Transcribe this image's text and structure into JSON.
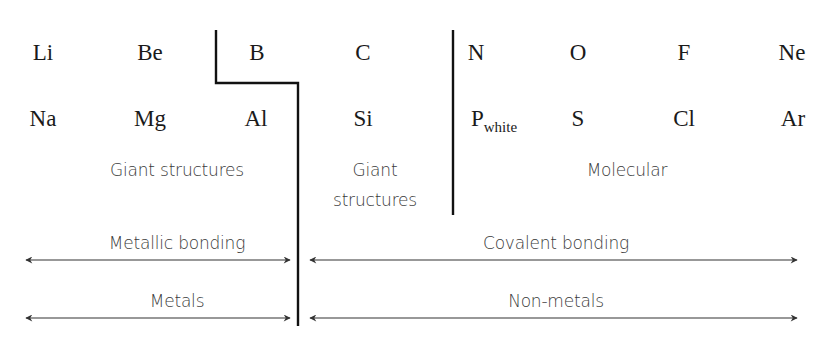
{
  "elements": {
    "row1": [
      {
        "symbol": "Li",
        "x": 43,
        "y": 41
      },
      {
        "symbol": "Be",
        "x": 150,
        "y": 41
      },
      {
        "symbol": "B",
        "x": 257,
        "y": 41
      },
      {
        "symbol": "C",
        "x": 363,
        "y": 41
      },
      {
        "symbol": "N",
        "x": 476,
        "y": 41
      },
      {
        "symbol": "O",
        "x": 578,
        "y": 41
      },
      {
        "symbol": "F",
        "x": 684,
        "y": 41
      },
      {
        "symbol": "Ne",
        "x": 792,
        "y": 41
      }
    ],
    "row2": [
      {
        "symbol": "Na",
        "x": 43,
        "y": 107
      },
      {
        "symbol": "Mg",
        "x": 150,
        "y": 107
      },
      {
        "symbol": "Al",
        "x": 256,
        "y": 107
      },
      {
        "symbol": "Si",
        "x": 363,
        "y": 107
      },
      {
        "symbol": "P",
        "subscript": "white",
        "x": 494,
        "y": 107
      },
      {
        "symbol": "S",
        "x": 578,
        "y": 107
      },
      {
        "symbol": "Cl",
        "x": 684,
        "y": 107
      },
      {
        "symbol": "Ar",
        "x": 793,
        "y": 107
      }
    ]
  },
  "structure_labels": {
    "metal_giant": "Giant structures",
    "nonmetal_giant_line1": "Giant",
    "nonmetal_giant_line2": "structures",
    "molecular": "Molecular"
  },
  "bonding_labels": {
    "metallic": "Metallic bonding",
    "covalent": "Covalent bonding"
  },
  "classification_labels": {
    "metals": "Metals",
    "non_metals": "Non-metals"
  },
  "colors": {
    "line": "#111111",
    "arrow": "#333333",
    "text": "#1a1a1a",
    "label": "#3a3a3a"
  }
}
